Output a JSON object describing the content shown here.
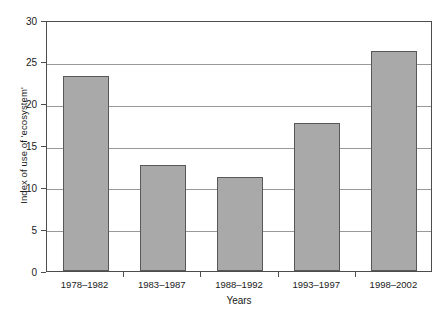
{
  "chart_data": {
    "type": "bar",
    "title": "",
    "xlabel": "Years",
    "ylabel": "Index of use of 'ecosystem'",
    "categories": [
      "1978–1982",
      "1983–1987",
      "1988–1992",
      "1993–1997",
      "1998–2002"
    ],
    "values": [
      23.3,
      12.7,
      11.2,
      17.7,
      26.3
    ],
    "ylim": [
      0,
      30
    ],
    "yticks": [
      0,
      5,
      10,
      15,
      20,
      25,
      30
    ],
    "ytick_labels": [
      "0",
      "5",
      "10",
      "15",
      "20",
      "25",
      "30"
    ],
    "grid": true,
    "legend": false,
    "bar_color": "#a9a9a9",
    "bar_edge_color": "#585858",
    "axis_color": "#4d4d4d",
    "grid_color": "#999999",
    "background": "#ffffff"
  }
}
